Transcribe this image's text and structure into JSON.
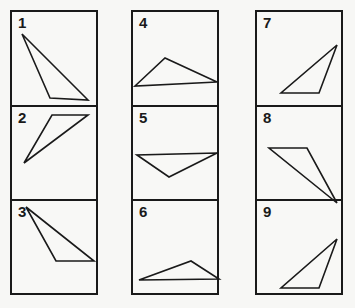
{
  "figure": {
    "columns": [
      {
        "left": 10,
        "panels": [
          {
            "number": "1",
            "height": 93,
            "points": [
              [
                10,
                14
              ],
              [
                38,
                78
              ],
              [
                76,
                80
              ]
            ]
          },
          {
            "number": "2",
            "height": 94,
            "points": [
              [
                40,
                0
              ],
              [
                76,
                0
              ],
              [
                12,
                48
              ]
            ]
          },
          {
            "number": "3",
            "height": 98,
            "points": [
              [
                14,
                -2
              ],
              [
                44,
                52
              ],
              [
                82,
                52
              ]
            ]
          }
        ]
      },
      {
        "left": 131,
        "panels": [
          {
            "number": "4",
            "height": 93,
            "points": [
              [
                2,
                66
              ],
              [
                32,
                38
              ],
              [
                84,
                62
              ]
            ]
          },
          {
            "number": "5",
            "height": 94,
            "points": [
              [
                4,
                40
              ],
              [
                36,
                62
              ],
              [
                84,
                38
              ]
            ]
          },
          {
            "number": "6",
            "height": 98,
            "points": [
              [
                6,
                71
              ],
              [
                58,
                52
              ],
              [
                86,
                70
              ]
            ]
          }
        ]
      },
      {
        "left": 255,
        "panels": [
          {
            "number": "7",
            "height": 93,
            "points": [
              [
                80,
                25
              ],
              [
                62,
                73
              ],
              [
                24,
                73
              ]
            ]
          },
          {
            "number": "8",
            "height": 94,
            "points": [
              [
                12,
                33
              ],
              [
                50,
                33
              ],
              [
                80,
                88
              ]
            ]
          },
          {
            "number": "9",
            "height": 98,
            "points": [
              [
                80,
                30
              ],
              [
                62,
                79
              ],
              [
                24,
                79
              ]
            ]
          }
        ]
      }
    ],
    "colors": {
      "line": "#1a1a1a",
      "background": "#f7f7f5"
    }
  }
}
